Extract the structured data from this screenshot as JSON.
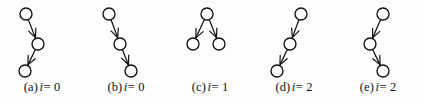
{
  "figure": {
    "background_color": "#fdfdfd",
    "stroke_color": "#101010",
    "node_fill_color": "#ffffff",
    "node_radius": 6,
    "panels": [
      {
        "id": "a",
        "caption_label": "(a)",
        "caption_variable": "i",
        "caption_equals": "=",
        "caption_value": "0",
        "caption_full": "(a) i = 0",
        "panel_left": 0,
        "graph_type": "chain",
        "nodes": [
          {
            "name": "node-top",
            "cx": 26,
            "cy": 14
          },
          {
            "name": "node-middle",
            "cx": 38,
            "cy": 44
          },
          {
            "name": "node-bottom",
            "cx": 25,
            "cy": 71
          }
        ],
        "edges": [
          {
            "from": 0,
            "to": 1,
            "directed": true
          },
          {
            "from": 1,
            "to": 2,
            "directed": true
          }
        ]
      },
      {
        "id": "b",
        "caption_label": "(b)",
        "caption_variable": "i",
        "caption_equals": "=",
        "caption_value": "0",
        "caption_full": "(b) i = 0",
        "panel_left": 84,
        "graph_type": "chain",
        "nodes": [
          {
            "name": "node-top",
            "cx": 25,
            "cy": 14
          },
          {
            "name": "node-middle",
            "cx": 36,
            "cy": 44
          },
          {
            "name": "node-bottom",
            "cx": 47,
            "cy": 71
          }
        ],
        "edges": [
          {
            "from": 0,
            "to": 1,
            "directed": true
          },
          {
            "from": 1,
            "to": 2,
            "directed": true
          }
        ]
      },
      {
        "id": "c",
        "caption_label": "(c)",
        "caption_variable": "i",
        "caption_equals": "=",
        "caption_value": "1",
        "caption_full": "(c) i = 1",
        "panel_left": 168,
        "graph_type": "tree",
        "nodes": [
          {
            "name": "node-parent",
            "cx": 39,
            "cy": 14
          },
          {
            "name": "node-child-left",
            "cx": 25,
            "cy": 44
          },
          {
            "name": "node-child-right",
            "cx": 51,
            "cy": 44
          }
        ],
        "edges": [
          {
            "from": 0,
            "to": 1,
            "directed": true
          },
          {
            "from": 0,
            "to": 2,
            "directed": true
          }
        ]
      },
      {
        "id": "d",
        "caption_label": "(d)",
        "caption_variable": "i",
        "caption_equals": "=",
        "caption_value": "2",
        "caption_full": "(d) i = 2",
        "panel_left": 252,
        "graph_type": "chain",
        "nodes": [
          {
            "name": "node-top",
            "cx": 49,
            "cy": 14
          },
          {
            "name": "node-middle",
            "cx": 38,
            "cy": 44
          },
          {
            "name": "node-bottom",
            "cx": 25,
            "cy": 71
          }
        ],
        "edges": [
          {
            "from": 0,
            "to": 1,
            "directed": true
          },
          {
            "from": 1,
            "to": 2,
            "directed": true
          }
        ]
      },
      {
        "id": "e",
        "caption_label": "(e)",
        "caption_variable": "i",
        "caption_equals": "=",
        "caption_value": "2",
        "caption_full": "(e) i = 2",
        "panel_left": 336,
        "graph_type": "chain",
        "nodes": [
          {
            "name": "node-top",
            "cx": 47,
            "cy": 14
          },
          {
            "name": "node-middle",
            "cx": 34,
            "cy": 44
          },
          {
            "name": "node-bottom",
            "cx": 47,
            "cy": 71
          }
        ],
        "edges": [
          {
            "from": 0,
            "to": 1,
            "directed": true
          },
          {
            "from": 1,
            "to": 2,
            "directed": true
          }
        ]
      }
    ]
  }
}
